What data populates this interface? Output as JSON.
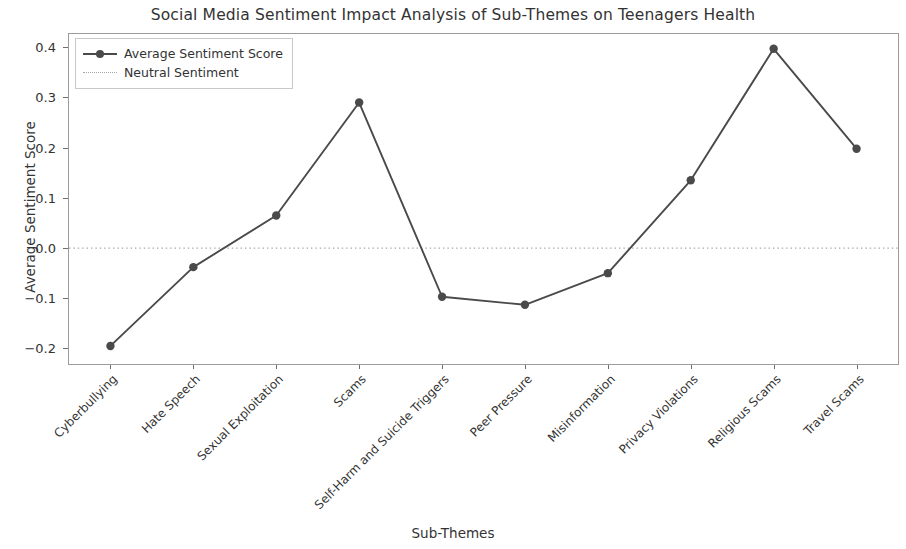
{
  "chart_data": {
    "type": "line",
    "title": "Social Media Sentiment Impact Analysis of Sub-Themes on Teenagers Health",
    "xlabel": "Sub-Themes",
    "ylabel": "Average Sentiment Score",
    "categories": [
      "Cyberbullying",
      "Hate Speech",
      "Sexual Exploitation",
      "Scams",
      "Self-Harm and Suicide Triggers",
      "Peer Pressure",
      "Misinformation",
      "Privacy Violations",
      "Religious Scams",
      "Travel Scams"
    ],
    "series": [
      {
        "name": "Average Sentiment Score",
        "values": [
          -0.195,
          -0.038,
          0.065,
          0.29,
          -0.097,
          -0.113,
          -0.05,
          0.135,
          0.397,
          0.198
        ],
        "color": "#4a4a4a",
        "marker": "circle",
        "linestyle": "solid"
      }
    ],
    "reference_lines": [
      {
        "name": "Neutral Sentiment",
        "value": 0.0,
        "color": "#a5a5a5",
        "linestyle": "dotted"
      }
    ],
    "yticks": [
      -0.2,
      -0.1,
      0.0,
      0.1,
      0.2,
      0.3,
      0.4
    ],
    "ytick_labels": [
      "-0.2",
      "-0.1",
      "0.0",
      "0.1",
      "0.2",
      "0.3",
      "0.4"
    ],
    "ylim": [
      -0.231,
      0.4265
    ],
    "grid": false,
    "legend_position": "upper left",
    "legend_entries": [
      "Average Sentiment Score",
      "Neutral Sentiment"
    ]
  }
}
